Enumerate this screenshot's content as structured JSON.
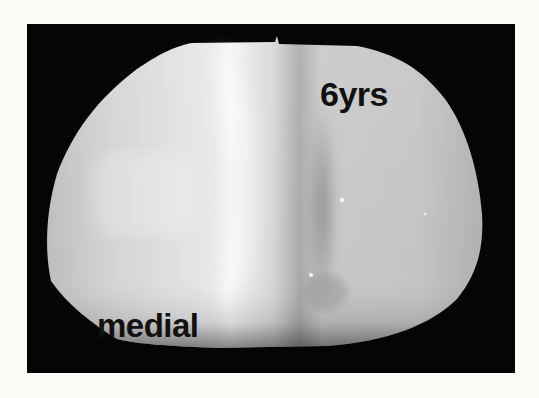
{
  "image": {
    "subject": "polyethylene tibial insert photograph",
    "labels": {
      "duration": "6yrs",
      "side": "medial"
    },
    "colors": {
      "page_background": "#fbfaf5",
      "frame_background": "#050505",
      "object_base": "#c9c9c9",
      "object_highlight": "#f2f2f2",
      "label_text": "#111111"
    }
  }
}
